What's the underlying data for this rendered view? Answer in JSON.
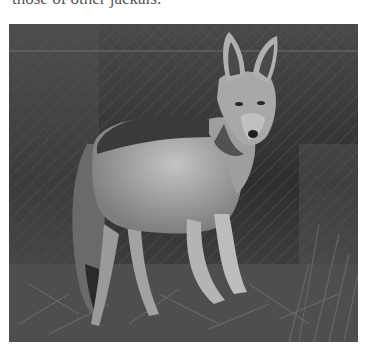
{
  "caption": {
    "text": "those of other jackals."
  },
  "photo": {
    "subject": "jackal",
    "description": "Grayscale photograph of a black-backed jackal standing in dry brush, looking toward the camera",
    "palette": {
      "background_dark": "#2a2a2a",
      "brush_mid": "#4a4a4a",
      "fur_light": "#b8b8b8",
      "fur_mid": "#8a8a8a",
      "saddle_dark": "#3c3c3c",
      "ground": "#555555"
    }
  }
}
